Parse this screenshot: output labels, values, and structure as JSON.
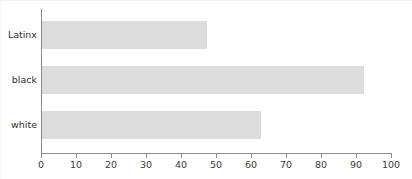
{
  "chart_data": {
    "type": "bar",
    "orientation": "horizontal",
    "title": "",
    "xlabel": "",
    "ylabel": "",
    "categories": [
      "Latinx",
      "black",
      "white"
    ],
    "values": [
      47,
      92,
      62.5
    ],
    "xlim": [
      0,
      100
    ],
    "xticks": [
      0,
      10,
      20,
      30,
      40,
      50,
      60,
      70,
      80,
      90,
      100
    ],
    "xtick_labels": [
      "0",
      "10",
      "20",
      "30",
      "40",
      "50",
      "60",
      "70",
      "80",
      "90",
      "100"
    ],
    "grid": false,
    "legend": null,
    "bar_color": "#dcdcdc",
    "axis_color": "#8c8c8c",
    "background_color": "#ffffff",
    "series": [
      {
        "name": "",
        "values": [
          47,
          92,
          62.5
        ]
      }
    ]
  }
}
